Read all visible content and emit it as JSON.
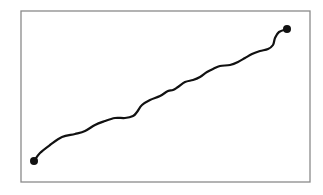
{
  "diagram": {
    "frame": {
      "x": 21,
      "y": 11,
      "width": 289,
      "height": 171,
      "stroke": "#8a8a8a"
    },
    "path": {
      "stroke": "#111111",
      "points": [
        [
          34,
          161
        ],
        [
          40,
          153
        ],
        [
          50,
          145
        ],
        [
          62,
          137
        ],
        [
          75,
          134
        ],
        [
          85,
          131
        ],
        [
          95,
          125
        ],
        [
          105,
          121
        ],
        [
          115,
          118
        ],
        [
          125,
          118
        ],
        [
          133,
          116
        ],
        [
          137,
          112
        ],
        [
          142,
          105
        ],
        [
          150,
          100
        ],
        [
          160,
          96
        ],
        [
          168,
          91
        ],
        [
          173,
          90
        ],
        [
          178,
          87
        ],
        [
          185,
          82
        ],
        [
          193,
          80
        ],
        [
          200,
          77
        ],
        [
          207,
          72
        ],
        [
          213,
          69
        ],
        [
          220,
          66
        ],
        [
          230,
          65
        ],
        [
          238,
          62
        ],
        [
          245,
          58
        ],
        [
          252,
          54
        ],
        [
          260,
          51
        ],
        [
          268,
          49
        ],
        [
          273,
          45
        ],
        [
          275,
          38
        ],
        [
          279,
          32
        ],
        [
          287,
          29
        ]
      ]
    },
    "start_point": {
      "x": 34,
      "y": 161,
      "color": "#111111"
    },
    "end_point": {
      "x": 287,
      "y": 29,
      "color": "#111111"
    }
  }
}
